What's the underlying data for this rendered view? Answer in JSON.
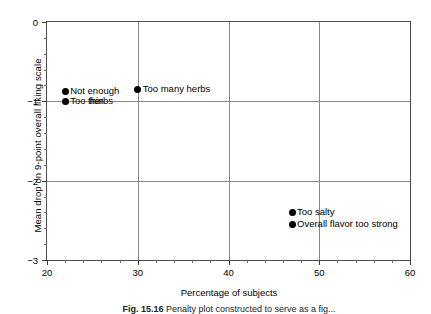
{
  "chart_data": {
    "type": "scatter",
    "title": "",
    "xlabel": "Percentage of subjects",
    "ylabel": "Mean drop on 9-point overall liking scale",
    "xlim": [
      20,
      60
    ],
    "ylim": [
      0,
      -3
    ],
    "y_inverted": true,
    "grid": true,
    "legend": "none",
    "x_ticks": [
      {
        "value": 20,
        "label": "20"
      },
      {
        "value": 30,
        "label": "30"
      },
      {
        "value": 40,
        "label": "40"
      },
      {
        "value": 50,
        "label": "50"
      },
      {
        "value": 60,
        "label": "60"
      }
    ],
    "x_minor_tick_step": 2,
    "y_ticks": [
      {
        "value": -3,
        "label": "−3"
      },
      {
        "value": -2,
        "label": "−2"
      },
      {
        "value": -1,
        "label": "−1"
      },
      {
        "value": 0,
        "label": "0"
      }
    ],
    "y_minor_tick_step": 0.2,
    "gridlines_x": [
      30,
      40,
      50
    ],
    "gridlines_y": [
      -2,
      -1
    ],
    "points": [
      {
        "label": "Overall flavor too strong",
        "x": 47,
        "y": -2.55,
        "label_position": "right",
        "wrap": false
      },
      {
        "label": "Too salty",
        "x": 47,
        "y": -2.4,
        "label_position": "right",
        "wrap": false
      },
      {
        "label": "Too thin",
        "x": 22,
        "y": -1.0,
        "label_position": "right",
        "wrap": false
      },
      {
        "label": "Not enough herbs",
        "x": 22,
        "y": -0.87,
        "label_position": "right",
        "wrap": true,
        "line1": "Not enough",
        "line2": "herbs"
      },
      {
        "label": "Too many herbs",
        "x": 30,
        "y": -0.85,
        "label_position": "right",
        "wrap": false
      }
    ],
    "colors": {
      "point": "#000000",
      "grid": "#8a8a8a",
      "frame": "#4d4d4d",
      "text": "#000000"
    }
  },
  "caption": {
    "number": "Fig. 15.16",
    "text": "Penalty plot constructed to serve as a fig..."
  }
}
